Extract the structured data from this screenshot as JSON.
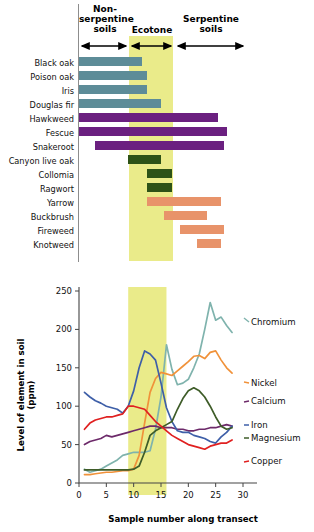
{
  "figure": {
    "zones": [
      {
        "name": "non-serpentine",
        "label_lines": [
          "Non-",
          "serpentine",
          "soils"
        ],
        "x_start": 0,
        "x_end": 9
      },
      {
        "name": "ecotone",
        "label_lines": [
          "Ecotone"
        ],
        "x_start": 9,
        "x_end": 16
      },
      {
        "name": "serpentine",
        "label_lines": [
          "Serpentine",
          "soils"
        ],
        "x_start": 16,
        "x_end": 30
      }
    ],
    "ecotone_band_color": "#eaeb8a"
  },
  "chart_data": [
    {
      "type": "bar",
      "title": "Species distribution along transect",
      "orientation": "horizontal",
      "xlabel": "",
      "ylabel": "",
      "xlim": [
        0,
        30
      ],
      "grid": false,
      "categories": [
        "Black oak",
        "Poison oak",
        "Iris",
        "Douglas fir",
        "Hawkweed",
        "Fescue",
        "Snakeroot",
        "Canyon live oak",
        "Collomia",
        "Ragwort",
        "Yarrow",
        "Buckbrush",
        "Fireweed",
        "Knotweed"
      ],
      "bars": [
        {
          "label": "Black oak",
          "start": 0,
          "end": 11.5,
          "color": "#5d8c98",
          "group": "non-serpentine"
        },
        {
          "label": "Poison oak",
          "start": 0,
          "end": 12.5,
          "color": "#5d8c98",
          "group": "non-serpentine"
        },
        {
          "label": "Iris",
          "start": 0,
          "end": 12.5,
          "color": "#5d8c98",
          "group": "non-serpentine"
        },
        {
          "label": "Douglas fir",
          "start": 0,
          "end": 15.0,
          "color": "#5d8c98",
          "group": "non-serpentine"
        },
        {
          "label": "Hawkweed",
          "start": 0,
          "end": 25.5,
          "color": "#6b2080",
          "group": "generalist"
        },
        {
          "label": "Fescue",
          "start": 0,
          "end": 27.0,
          "color": "#6b2080",
          "group": "generalist"
        },
        {
          "label": "Snakeroot",
          "start": 3.0,
          "end": 26.5,
          "color": "#6b2080",
          "group": "generalist"
        },
        {
          "label": "Canyon live oak",
          "start": 9.0,
          "end": 15.0,
          "color": "#2d5217",
          "group": "ecotone"
        },
        {
          "label": "Collomia",
          "start": 12.5,
          "end": 17.0,
          "color": "#2d5217",
          "group": "ecotone"
        },
        {
          "label": "Ragwort",
          "start": 12.5,
          "end": 17.0,
          "color": "#2d5217",
          "group": "ecotone"
        },
        {
          "label": "Yarrow",
          "start": 12.5,
          "end": 26.0,
          "color": "#e8936a",
          "group": "serpentine"
        },
        {
          "label": "Buckbrush",
          "start": 15.5,
          "end": 23.5,
          "color": "#e8936a",
          "group": "serpentine"
        },
        {
          "label": "Fireweed",
          "start": 18.5,
          "end": 26.5,
          "color": "#e8936a",
          "group": "serpentine"
        },
        {
          "label": "Knotweed",
          "start": 21.5,
          "end": 26.0,
          "color": "#e8936a",
          "group": "serpentine"
        }
      ]
    },
    {
      "type": "line",
      "title": "Level of element in soil along transect",
      "xlabel": "Sample number along transect",
      "ylabel": "Level of element in soil (ppm)",
      "xlim": [
        0,
        30
      ],
      "ylim": [
        0,
        250
      ],
      "xticks": [
        0,
        5,
        10,
        15,
        20,
        25,
        30
      ],
      "yticks": [
        0,
        50,
        100,
        150,
        200,
        250
      ],
      "grid": false,
      "legend_position": "right-inline",
      "x": [
        1,
        2,
        3,
        4,
        5,
        6,
        7,
        8,
        9,
        10,
        11,
        12,
        13,
        14,
        15,
        16,
        17,
        18,
        19,
        20,
        21,
        22,
        23,
        24,
        25,
        26,
        27,
        28
      ],
      "series": [
        {
          "name": "Chromium",
          "color": "#7fb3ad",
          "values": [
            18,
            14,
            16,
            18,
            22,
            26,
            30,
            36,
            38,
            40,
            40,
            40,
            42,
            70,
            112,
            180,
            148,
            128,
            130,
            135,
            150,
            168,
            200,
            235,
            212,
            216,
            205,
            196
          ]
        },
        {
          "name": "Nickel",
          "color": "#f0923a",
          "values": [
            11,
            11,
            12,
            13,
            14,
            14,
            15,
            16,
            16,
            18,
            36,
            78,
            118,
            136,
            144,
            142,
            140,
            146,
            152,
            158,
            165,
            166,
            162,
            170,
            172,
            160,
            150,
            143
          ]
        },
        {
          "name": "Calcium",
          "color": "#6d2a6a",
          "values": [
            50,
            54,
            56,
            58,
            62,
            60,
            62,
            64,
            66,
            68,
            70,
            72,
            74,
            74,
            72,
            72,
            72,
            70,
            70,
            68,
            68,
            70,
            70,
            72,
            72,
            74,
            76,
            74
          ]
        },
        {
          "name": "Iron",
          "color": "#3e5fa8",
          "values": [
            118,
            112,
            107,
            104,
            100,
            98,
            96,
            91,
            100,
            120,
            150,
            172,
            168,
            160,
            130,
            98,
            80,
            68,
            66,
            66,
            62,
            60,
            58,
            54,
            52,
            60,
            66,
            74
          ]
        },
        {
          "name": "Magnesium",
          "color": "#3e5c28",
          "values": [
            17,
            17,
            17,
            17,
            17,
            17,
            17,
            17,
            17,
            18,
            22,
            40,
            62,
            68,
            72,
            76,
            80,
            96,
            110,
            120,
            124,
            120,
            112,
            100,
            86,
            74,
            70,
            72
          ]
        },
        {
          "name": "Copper",
          "color": "#e02020",
          "values": [
            70,
            78,
            82,
            84,
            86,
            86,
            88,
            90,
            100,
            100,
            98,
            96,
            88,
            80,
            74,
            68,
            62,
            58,
            54,
            50,
            48,
            46,
            44,
            48,
            50,
            52,
            52,
            56
          ]
        }
      ]
    }
  ],
  "labels": {
    "y_axis_title": "Level of element in soil (ppm)",
    "x_axis_title": "Sample number along transect"
  }
}
